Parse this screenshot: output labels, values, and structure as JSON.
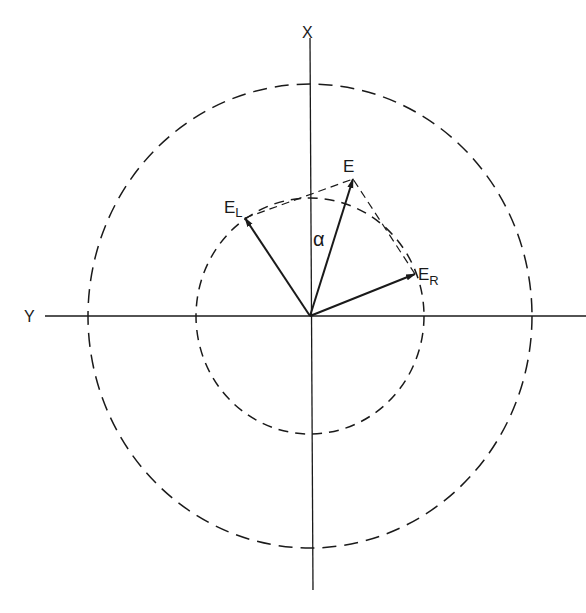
{
  "diagram": {
    "type": "vector-diagram",
    "axes": {
      "vertical_label": "X",
      "horizontal_label": "Y"
    },
    "circles": [
      {
        "name": "outer",
        "style": "dashed"
      },
      {
        "name": "inner",
        "style": "dashed"
      }
    ],
    "vectors": [
      {
        "name": "E",
        "label": "E"
      },
      {
        "name": "E_L",
        "label": "E",
        "subscript": "L"
      },
      {
        "name": "E_R",
        "label": "E",
        "subscript": "R"
      }
    ],
    "angle_label": "α",
    "colors": {
      "line": "#1a1a1a",
      "background": "#ffffff"
    }
  }
}
